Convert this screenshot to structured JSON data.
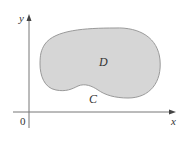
{
  "figure": {
    "region_label": "D",
    "curve_label": "C",
    "x_axis_label": "x",
    "y_axis_label": "y",
    "origin_label": "0",
    "colors": {
      "region_fill": "#d6d6d6",
      "region_stroke": "#9a9a9a",
      "axis": "#777777",
      "text": "#333333"
    }
  }
}
